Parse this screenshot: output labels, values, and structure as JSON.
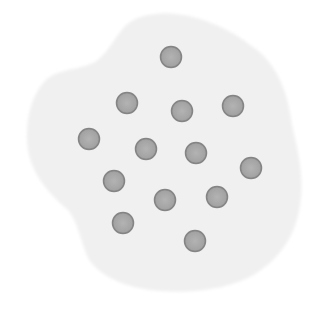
{
  "scene": {
    "description": "Irregular pale gray blob containing gray circular dots",
    "width": 313,
    "height": 315,
    "background_color": "#ffffff"
  },
  "blob": {
    "fill_color": "#f1f1f1",
    "edge_color": "#e6e6e6",
    "path": "M155,14 C185,10 225,25 250,45 C275,60 288,90 292,125 C298,150 305,180 300,205 C296,235 280,258 258,272 C235,288 195,294 160,291 C130,289 100,278 88,258 C80,240 78,222 68,210 C50,195 32,175 28,150 C24,120 32,92 48,78 C62,68 80,70 95,62 C110,52 118,30 130,22 C138,17 146,15 155,14 Z"
  },
  "dots": {
    "radius": 10.5,
    "fill_color": "#a9a9a9",
    "stroke_color": "#848484",
    "stroke_width": 1.5,
    "count": 13,
    "items": [
      {
        "cx": 171,
        "cy": 57
      },
      {
        "cx": 127,
        "cy": 103
      },
      {
        "cx": 182,
        "cy": 111
      },
      {
        "cx": 233,
        "cy": 106
      },
      {
        "cx": 89,
        "cy": 139
      },
      {
        "cx": 146,
        "cy": 149
      },
      {
        "cx": 196,
        "cy": 153
      },
      {
        "cx": 251,
        "cy": 168
      },
      {
        "cx": 114,
        "cy": 181
      },
      {
        "cx": 165,
        "cy": 200
      },
      {
        "cx": 217,
        "cy": 197
      },
      {
        "cx": 123,
        "cy": 223
      },
      {
        "cx": 195,
        "cy": 241
      }
    ]
  }
}
